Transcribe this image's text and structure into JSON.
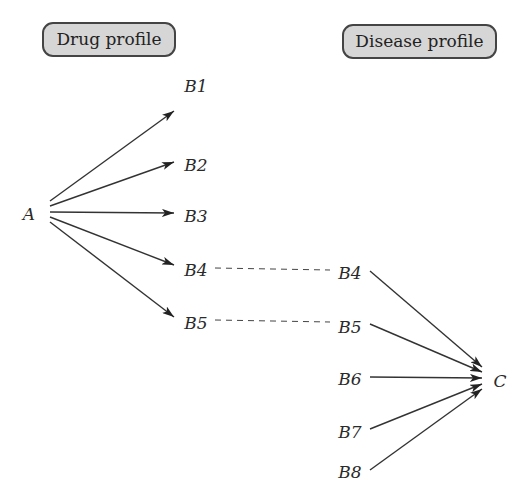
{
  "headers": {
    "drug_profile": "Drug profile",
    "disease_profile": "Disease profile"
  },
  "nodes": {
    "A": "A",
    "drug_side": [
      "B1",
      "B2",
      "B3",
      "B4",
      "B5"
    ],
    "disease_side": [
      "B4",
      "B5",
      "B6",
      "B7",
      "B8"
    ],
    "C": "C"
  },
  "edges": {
    "solid_arrows": [
      [
        "A",
        "B1"
      ],
      [
        "A",
        "B2"
      ],
      [
        "A",
        "B3"
      ],
      [
        "A",
        "B4"
      ],
      [
        "A",
        "B5"
      ],
      [
        "B4",
        "C"
      ],
      [
        "B5",
        "C"
      ],
      [
        "B6",
        "C"
      ],
      [
        "B7",
        "C"
      ],
      [
        "B8",
        "C"
      ]
    ],
    "dashed_links": [
      [
        "B4",
        "B4"
      ],
      [
        "B5",
        "B5"
      ]
    ]
  },
  "colors": {
    "box_fill": "#d6d6d6",
    "box_border": "#444444",
    "line": "#333333"
  }
}
